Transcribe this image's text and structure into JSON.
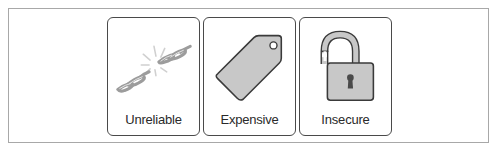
{
  "cards": [
    {
      "label": "Unreliable",
      "icon": "broken-chain-icon"
    },
    {
      "label": "Expensive",
      "icon": "price-tag-icon"
    },
    {
      "label": "Insecure",
      "icon": "open-padlock-icon"
    }
  ],
  "colors": {
    "frame_border": "#a8a8a8",
    "card_border": "#4a4a4a",
    "icon_fill": "#c8c8c8",
    "icon_stroke": "#3a3a3a",
    "text": "#2a2a2a"
  }
}
